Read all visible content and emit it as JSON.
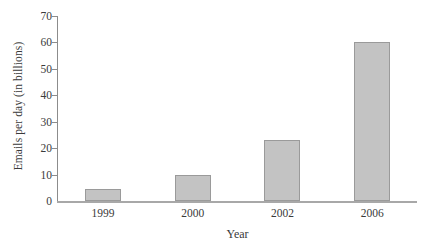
{
  "chart_data": {
    "type": "bar",
    "title": "",
    "subtitle": "",
    "categories": [
      "1999",
      "2000",
      "2002",
      "2006"
    ],
    "values": [
      4.5,
      10,
      23,
      60
    ],
    "xlabel": "Year",
    "ylabel": "Emails per day (in billions)",
    "ylim": [
      0,
      70
    ],
    "yticks": [
      0,
      10,
      20,
      30,
      40,
      50,
      60,
      70
    ],
    "ytick_labels": [
      "0",
      "10",
      "20",
      "30",
      "40",
      "50",
      "60",
      "70"
    ],
    "grid": false,
    "legend": null,
    "annotations": [],
    "colors": {
      "bar_fill": "#c3c3c3",
      "bar_border": "#9a9a9a",
      "axis": "#8c8c8c",
      "baseline": "#a8a8a8",
      "text": "#3a3a3a",
      "background": "#ffffff"
    }
  }
}
